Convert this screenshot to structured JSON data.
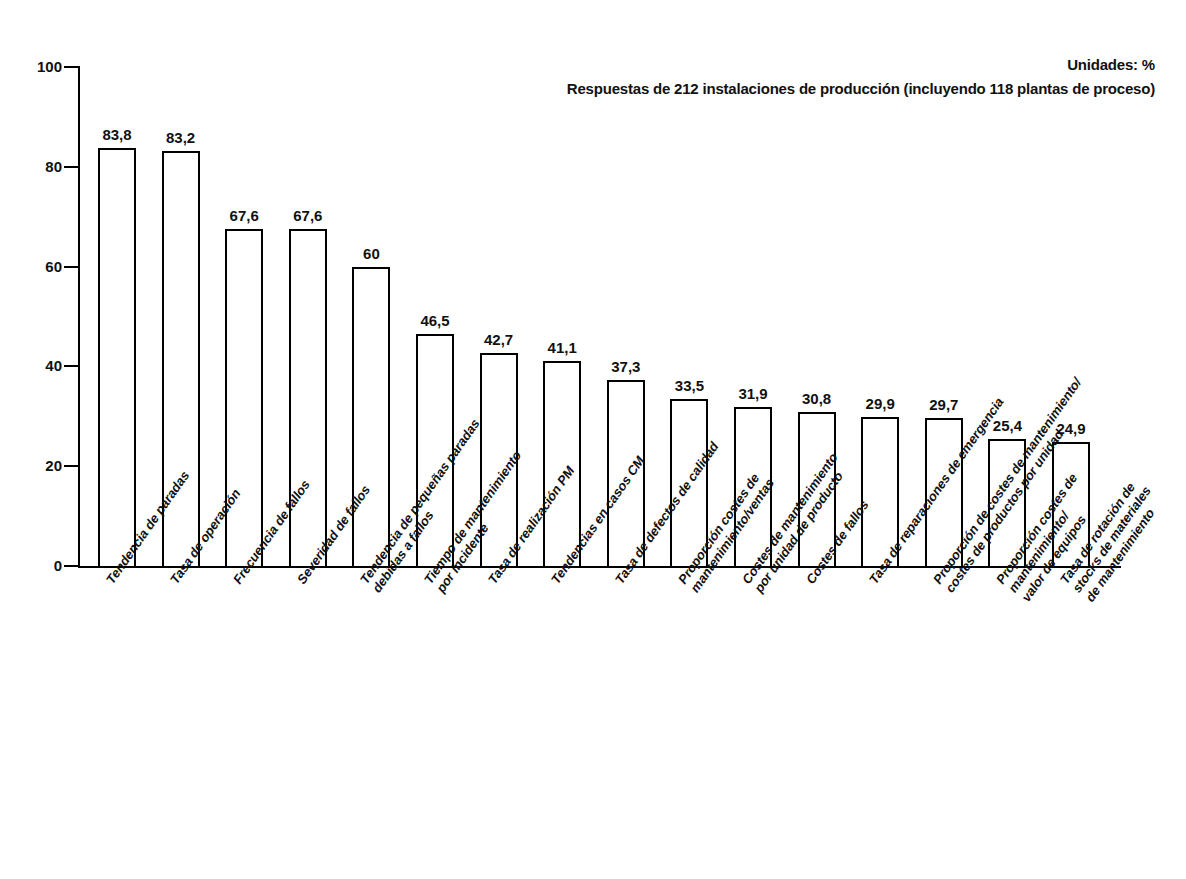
{
  "notes": {
    "units": "Unidades: %",
    "responses": "Respuestas de 212 instalaciones de producción (incluyendo 118 plantas de proceso)"
  },
  "chart_data": {
    "type": "bar",
    "title": "",
    "subtitle": "",
    "xlabel": "",
    "ylabel": "",
    "ylim": [
      0,
      100
    ],
    "yticks": [
      0,
      20,
      40,
      60,
      80,
      100
    ],
    "ytick_labels": [
      "0",
      "20",
      "40",
      "60",
      "80",
      "100"
    ],
    "grid": false,
    "legend": false,
    "value_label_format": "comma-decimal",
    "units": "%",
    "categories": [
      "Tendencia de paradas",
      "Tasa de operación",
      "Frecuencia de fallos",
      "Severidad de fallos",
      "Tendencia de pequeñas paradas\ndebidas a fallos",
      "Tiempo de mantenimiento\npor incidente",
      "Tasa de realización PM",
      "Tendencias en casos CM",
      "Tasa de defectos de calidad",
      "Proporción costes de\nmantenimiento/ventas",
      "Costes de mantenimiento\npor unidad de producto",
      "Costes de fallos",
      "Tasa de reparaciones de emergencia",
      "Proporción de costes de mantenimiento/\ncostes de productos por unidad",
      "Proporción costes de mantenimiento/\nvalor de equipos",
      "Tasa de rotación de stocks de materiales\nde mantenimiento"
    ],
    "values": [
      83.8,
      83.2,
      67.6,
      67.6,
      60,
      46.5,
      42.7,
      41.1,
      37.3,
      33.5,
      31.9,
      30.8,
      29.9,
      29.7,
      25.4,
      24.9
    ],
    "value_labels": [
      "83,8",
      "83,2",
      "67,6",
      "67,6",
      "60",
      "46,5",
      "42,7",
      "41,1",
      "37,3",
      "33,5",
      "31,9",
      "30,8",
      "29,9",
      "29,7",
      "25,4",
      "24,9"
    ],
    "colors": {
      "bar_fill": "#ffffff",
      "bar_stroke": "#000000",
      "axis": "#000000",
      "text": "#111111"
    }
  }
}
